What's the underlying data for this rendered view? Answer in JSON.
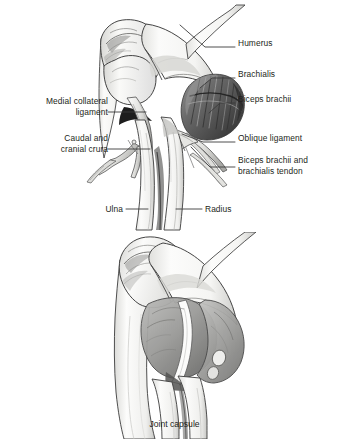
{
  "figure": {
    "title_hidden": "",
    "top_panel": {
      "name": "craniomedial elbow joint dissection",
      "labels": [
        {
          "id": "humerus",
          "text": "Humerus",
          "side": "right",
          "x": 238,
          "y": 43,
          "leader": "horizontal-then-up-left"
        },
        {
          "id": "brachialis",
          "text": "Brachialis",
          "side": "right",
          "x": 238,
          "y": 74,
          "leader": "diagonal-down-left"
        },
        {
          "id": "biceps-brachii",
          "text": "Biceps brachii",
          "side": "right",
          "x": 238,
          "y": 99,
          "leader": "diagonal-down-left"
        },
        {
          "id": "oblique-ligament",
          "text": "Oblique ligament",
          "side": "right",
          "x": 238,
          "y": 138,
          "leader": "horizontal-then-up-left"
        },
        {
          "id": "biceps-tendon",
          "text": "Biceps brachii and\nbrachialis tendon",
          "side": "right",
          "x": 238,
          "y": 160,
          "leader": "diagonal-up-left"
        },
        {
          "id": "medial-collateral-ligament",
          "text": "Medial collateral\nligament",
          "side": "left",
          "x": 18,
          "y": 101,
          "leader": "horizontal-right"
        },
        {
          "id": "caudal-cranial-crura",
          "text": "Caudal and\ncranial crura",
          "side": "left",
          "x": 33,
          "y": 138,
          "leader": "horizontal-right"
        },
        {
          "id": "ulna",
          "text": "Ulna",
          "side": "left",
          "x": 109,
          "y": 205,
          "leader": "horizontal-right"
        },
        {
          "id": "radius",
          "text": "Radius",
          "side": "right",
          "x": 205,
          "y": 205,
          "leader": "horizontal-left"
        }
      ]
    },
    "bottom_panel": {
      "name": "elbow joint capsule",
      "caption": "Joint capsule",
      "caption_y": 419
    }
  },
  "colors": {
    "background": "#ffffff",
    "ink": "#231f20",
    "leader_line": "#3b3b3b",
    "bone_fill": "#fbfbfa",
    "bone_shadow": "#d6d6d4",
    "bone_outline": "#3a3a3a",
    "muscle_dark": "#4a4a4a",
    "muscle_mid": "#7d7d7d",
    "capsule_gray": "#9a9a9a",
    "capsule_light": "#c4c4c4",
    "cartilage": "#f2f2f0"
  }
}
